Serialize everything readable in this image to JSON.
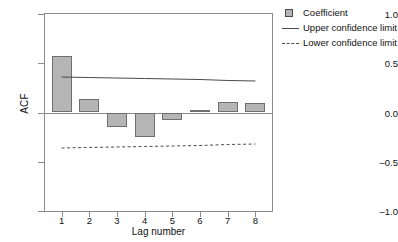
{
  "chart_data": {
    "type": "bar",
    "title": "",
    "xlabel": "Lag number",
    "ylabel": "ACF",
    "categories": [
      "1",
      "2",
      "3",
      "4",
      "5",
      "6",
      "7",
      "8"
    ],
    "x": [
      1,
      2,
      3,
      4,
      5,
      6,
      7,
      8
    ],
    "values": [
      0.575,
      0.14,
      -0.15,
      -0.25,
      -0.08,
      0.03,
      0.11,
      0.1
    ],
    "series": [
      {
        "name": "Coefficient",
        "type": "bar",
        "values": [
          0.575,
          0.14,
          -0.15,
          -0.25,
          -0.08,
          0.03,
          0.11,
          0.1
        ]
      },
      {
        "name": "Upper confidence limit",
        "type": "line",
        "style": "solid",
        "values": [
          0.36,
          0.355,
          0.35,
          0.345,
          0.34,
          0.335,
          0.325,
          0.32
        ]
      },
      {
        "name": "Lower confidence limit",
        "type": "line",
        "style": "dashed",
        "values": [
          -0.36,
          -0.355,
          -0.35,
          -0.345,
          -0.34,
          -0.335,
          -0.325,
          -0.32
        ]
      }
    ],
    "ylim": [
      -1.0,
      1.0
    ],
    "yticks": [
      1.0,
      0.5,
      0.0,
      -0.5,
      -1.0
    ],
    "ytick_labels": [
      "1.0",
      "0.5",
      "0.0",
      "–0.5",
      "–1.0"
    ],
    "xlim": [
      0.4,
      8.6
    ],
    "xticks": [
      1,
      2,
      3,
      4,
      5,
      6,
      7,
      8
    ],
    "xtick_labels": [
      "1",
      "2",
      "3",
      "4",
      "5",
      "6",
      "7",
      "8"
    ],
    "grid": false,
    "legend_position": "top-right",
    "legend": [
      {
        "label": "Coefficient",
        "key": "filled-square",
        "color": "#b5b5b5"
      },
      {
        "label": "Upper confidence limit",
        "key": "solid-line",
        "color": "#4a4a4a"
      },
      {
        "label": "Lower confidence limit",
        "key": "dashed-line",
        "color": "#4a4a4a"
      }
    ],
    "colors": {
      "bar_fill": "#b5b5b5",
      "bar_stroke": "#6f6f6f",
      "axis": "#8a8a8a",
      "line": "#4a4a4a",
      "text": "#111111",
      "background": "#ffffff"
    }
  }
}
